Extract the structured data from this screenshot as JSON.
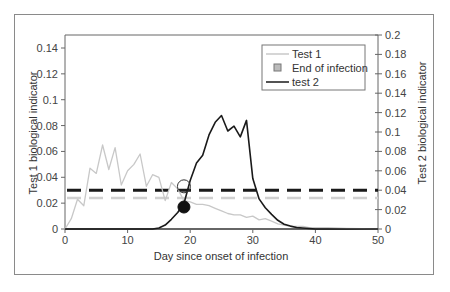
{
  "chart_data": {
    "type": "line",
    "title": "",
    "xlabel": "Day since onset of infection",
    "ylabel": "Test 1 biological indicator",
    "y2label": "Test 2 biological indicator",
    "xlim": [
      0,
      50
    ],
    "ylim": [
      0,
      0.15
    ],
    "y2lim": [
      0,
      0.2
    ],
    "x_ticks": [
      "0",
      "10",
      "20",
      "30",
      "40",
      "50"
    ],
    "y_ticks": [
      "0",
      "0.02",
      "0.04",
      "0.06",
      "0.08",
      "0.1",
      "0.12",
      "0.14"
    ],
    "y2_ticks": [
      "0",
      "0.02",
      "0.04",
      "0.06",
      "0.08",
      "0.1",
      "0.12",
      "0.14",
      "0.16",
      "0.18",
      "0.2"
    ],
    "grid": false,
    "legend_position": "upper right",
    "legend": [
      "Test 1",
      "End of infection",
      "test 2"
    ],
    "series": [
      {
        "name": "Test 1",
        "axis": "left",
        "color": "#c8c8c8",
        "x": [
          0,
          1,
          2,
          3,
          4,
          5,
          6,
          7,
          8,
          9,
          10,
          11,
          12,
          13,
          14,
          15,
          16,
          17,
          18,
          19,
          20,
          21,
          22,
          23,
          24,
          25,
          26,
          27,
          28,
          29,
          30,
          31,
          32,
          33,
          34,
          35,
          36,
          37,
          38,
          39,
          40,
          42,
          45,
          50
        ],
        "values": [
          0,
          0.008,
          0.023,
          0.018,
          0.047,
          0.043,
          0.065,
          0.046,
          0.063,
          0.034,
          0.045,
          0.05,
          0.058,
          0.033,
          0.042,
          0.04,
          0.022,
          0.036,
          0.031,
          0.022,
          0.021,
          0.019,
          0.019,
          0.018,
          0.016,
          0.014,
          0.012,
          0.011,
          0.011,
          0.009,
          0.01,
          0.007,
          0.008,
          0.006,
          0.004,
          0.003,
          0.002,
          0.002,
          0.002,
          0.001,
          0.001,
          0.001,
          0.0005,
          0
        ]
      },
      {
        "name": "test 2",
        "axis": "right",
        "color": "#1a1a1a",
        "x": [
          0,
          5,
          10,
          14,
          15,
          16,
          17,
          18,
          19,
          20,
          21,
          22,
          23,
          24,
          25,
          26,
          27,
          28,
          29,
          30,
          31,
          32,
          33,
          34,
          35,
          36,
          37,
          38,
          40,
          45,
          50
        ],
        "values": [
          0,
          0,
          0,
          0,
          0.001,
          0.004,
          0.01,
          0.017,
          0.026,
          0.05,
          0.068,
          0.076,
          0.097,
          0.11,
          0.117,
          0.101,
          0.106,
          0.095,
          0.112,
          0.052,
          0.031,
          0.022,
          0.015,
          0.009,
          0.005,
          0.003,
          0.0015,
          0.001,
          0,
          0,
          0
        ]
      }
    ],
    "thresholds": [
      {
        "name": "Test 2 threshold",
        "axis": "right",
        "value": 0.04,
        "style": "dashed",
        "color": "#1a1a1a"
      },
      {
        "name": "Test 1 threshold",
        "axis": "left",
        "value": 0.024,
        "style": "dashed",
        "color": "#d0d0d0"
      }
    ],
    "markers": [
      {
        "name": "Test 1 end of infection",
        "x": 19,
        "value": 0.033,
        "axis": "left",
        "style": "open-circle"
      },
      {
        "name": "Test 2 end of infection",
        "x": 19,
        "value": 0.017,
        "axis": "left",
        "style": "filled-circle"
      }
    ]
  },
  "labels": {
    "xlabel": "Day since onset of infection",
    "ylabel": "Test 1 biological indicator",
    "y2label": "Test 2 biological indicator",
    "legend": {
      "test1": "Test 1",
      "end": "End of infection",
      "test2": "test 2"
    },
    "x_ticks": [
      "0",
      "10",
      "20",
      "30",
      "40",
      "50"
    ],
    "y_ticks": [
      "0",
      "0.02",
      "0.04",
      "0.06",
      "0.08",
      "0.1",
      "0.12",
      "0.14"
    ],
    "y2_ticks": [
      "0",
      "0.02",
      "0.04",
      "0.06",
      "0.08",
      "0.1",
      "0.12",
      "0.14",
      "0.16",
      "0.18",
      "0.2"
    ]
  }
}
